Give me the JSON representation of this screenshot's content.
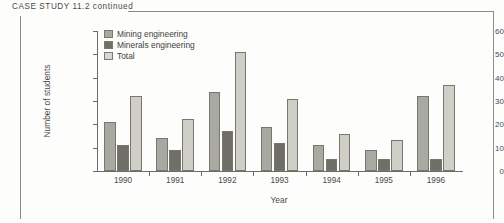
{
  "page": {
    "case_header": "CASE  STUDY  11.2  continued"
  },
  "chart_data": {
    "type": "bar",
    "title": "",
    "xlabel": "Year",
    "ylabel": "Number of students",
    "categories": [
      "1990",
      "1991",
      "1992",
      "1993",
      "1994",
      "1995",
      "1996"
    ],
    "series": [
      {
        "name": "Mining engineering",
        "color": "#a9a9a2",
        "values": [
          21,
          14,
          34,
          19,
          11,
          9,
          32
        ]
      },
      {
        "name": "Minerals engineering",
        "color": "#6f6f68",
        "values": [
          11,
          9,
          17,
          12,
          5,
          5,
          5
        ]
      },
      {
        "name": "Total",
        "color": "#cfcfc7",
        "values": [
          32,
          22.5,
          51,
          31,
          16,
          13.5,
          37
        ]
      }
    ],
    "ylim": [
      0,
      60
    ],
    "yticks": [
      0,
      10,
      20,
      30,
      40,
      50,
      60
    ],
    "grid": false,
    "legend_position": "top-left"
  }
}
